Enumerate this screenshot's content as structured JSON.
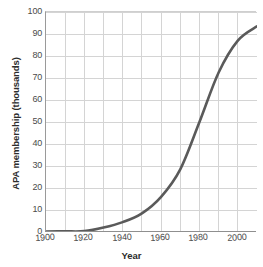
{
  "chart_data": {
    "type": "line",
    "title": "",
    "xlabel": "Year",
    "ylabel": "APA membership (thousands)",
    "xlim": [
      1900,
      2010
    ],
    "ylim": [
      0,
      100
    ],
    "xticks": [
      1900,
      1920,
      1940,
      1960,
      1980,
      2000
    ],
    "xtick_labels": [
      "1900",
      "1920",
      "1940",
      "1960",
      "1980",
      "2000"
    ],
    "yticks": [
      0,
      10,
      20,
      30,
      40,
      50,
      60,
      70,
      80,
      90,
      100
    ],
    "ytick_labels": [
      "0",
      "10",
      "20",
      "30",
      "40",
      "50",
      "60",
      "70",
      "80",
      "90",
      "100"
    ],
    "grid": true,
    "grid_x_step": 10,
    "grid_y_step": 10,
    "legend": "none",
    "line_color": "#5a5a5a",
    "grid_color": "#d4d4d4",
    "axis_color": "#8f8f8f",
    "x": [
      1900,
      1910,
      1920,
      1930,
      1940,
      1950,
      1960,
      1970,
      1980,
      1990,
      2000,
      2010
    ],
    "y": [
      0.2,
      0.3,
      0.4,
      2.0,
      4.5,
      8.5,
      16.0,
      28.5,
      50.0,
      72.5,
      87.0,
      93.5
    ],
    "series": [
      {
        "name": "APA membership",
        "values": [
          0.2,
          0.3,
          0.4,
          2.0,
          4.5,
          8.5,
          16.0,
          28.5,
          50.0,
          72.5,
          87.0,
          93.5
        ]
      }
    ]
  }
}
